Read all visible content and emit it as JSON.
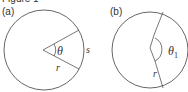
{
  "figure": {
    "top_fragment": "Figure 1",
    "panel_a": {
      "label": "(a)",
      "angle_label": "θ",
      "arc_label": "s",
      "radius_label": "r"
    },
    "panel_b": {
      "label": "(b)",
      "angle_label": "θ",
      "angle_subscript": "1",
      "radius_label": "r"
    },
    "colors": {
      "stroke": "#555555",
      "text": "#333333"
    }
  }
}
